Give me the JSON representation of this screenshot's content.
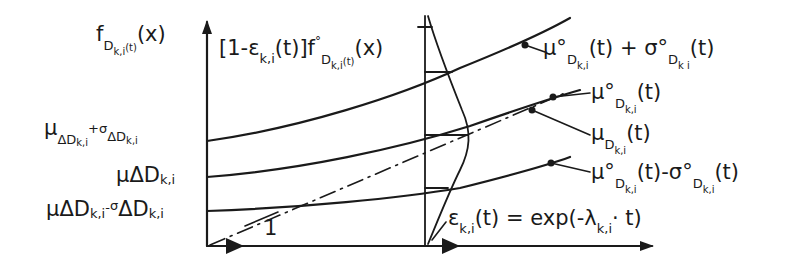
{
  "diagram": {
    "type": "stochastic degradation / wear-progress diagram",
    "axes": {
      "y_axis_label": {
        "base": "f",
        "sub": "D",
        "subsub": "k,i",
        "subarg": "(t)",
        "arg": "(x)"
      },
      "x_axis_direction": "right (time t)"
    },
    "density_label": {
      "pre": "[1-ε",
      "sub": "k,i",
      "mid": "(t)]f",
      "ring": "°",
      "sub2": "D",
      "subsub": "k,i",
      "subarg": "(t)",
      "arg": "(x)"
    },
    "left_levels": [
      {
        "id": "upper",
        "text_a": "μ",
        "sub_a": "ΔD",
        "subsub_a": "k,i",
        "op": "+",
        "text_b": "σ",
        "sub_b": "ΔD",
        "subsub_b": "k,i"
      },
      {
        "id": "mean",
        "text_a": "μ",
        "sub_a": "ΔD",
        "subsub_a": "k,i"
      },
      {
        "id": "lower",
        "text_a": "μ",
        "sub_a": "ΔD",
        "subsub_a": "k,i",
        "op": "-",
        "text_b": "σ",
        "sub_b": "ΔD",
        "subsub_b": "k,i"
      }
    ],
    "right_labels": [
      {
        "id": "upper",
        "text": "μ°",
        "sub": "D",
        "subsub": "k,i",
        "tail": "(t) + σ°",
        "sub2": "D",
        "subsub2": "k i",
        "tail2": "(t)"
      },
      {
        "id": "mean-nominal",
        "text": "μ°",
        "sub": "D",
        "subsub": "k,i",
        "tail": "(t)"
      },
      {
        "id": "mean-actual",
        "text": "μ",
        "sub": "D",
        "subsub": "k,i",
        "tail": "(t)"
      },
      {
        "id": "lower",
        "text": "μ°",
        "sub": "D",
        "subsub": "k,i",
        "tail": "(t)-σ°",
        "sub2": "D",
        "subsub2": "k,i",
        "tail2": "(t)"
      }
    ],
    "epsilon_label": {
      "pre": "ε",
      "sub": "k,i",
      "mid": "(t) = exp(-λ",
      "sub2": "k,i",
      "tail": "· t)"
    },
    "slope_label": "1",
    "colors": {
      "ink": "#1a1a1a",
      "background": "#ffffff"
    }
  }
}
